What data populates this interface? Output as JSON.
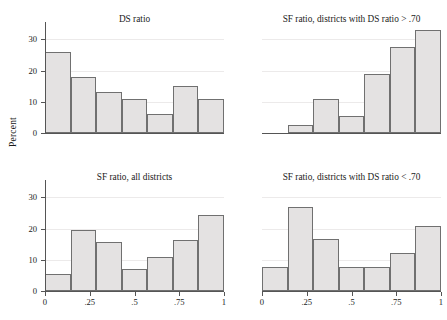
{
  "figure": {
    "ylabel": "Percent",
    "width": 439,
    "height": 320,
    "bar_fill": "#e4e2e2",
    "bar_stroke": "#707070",
    "grid_color": "#eceaea",
    "axis_color": "#555555"
  },
  "axes": {
    "y_ticks": [
      "0",
      "10",
      "20",
      "30"
    ],
    "y_values": [
      0,
      10,
      20,
      30
    ],
    "ylim": [
      0,
      34
    ],
    "x_ticks": [
      "0",
      ".25",
      ".5",
      ".75",
      "1"
    ],
    "x_values": [
      0,
      0.25,
      0.5,
      0.75,
      1
    ],
    "xlim": [
      0,
      1
    ]
  },
  "chart_data": [
    {
      "type": "bar",
      "panel": "top-left",
      "title": "DS ratio",
      "xlabel": "",
      "ylabel": "Percent",
      "ylim": [
        0,
        34
      ],
      "xlim": [
        0,
        1
      ],
      "grid": true,
      "bin_edges": [
        0,
        0.1429,
        0.2857,
        0.4286,
        0.5714,
        0.7143,
        0.8571,
        1.0
      ],
      "categories": [
        "0-.14",
        ".14-.29",
        ".29-.43",
        ".43-.57",
        ".57-.71",
        ".71-.86",
        ".86-1"
      ],
      "values": [
        26.0,
        18.0,
        13.2,
        11.0,
        6.2,
        15.0,
        11.0
      ]
    },
    {
      "type": "bar",
      "panel": "top-right",
      "title": "SF ratio, districts with DS ratio > .70",
      "xlabel": "",
      "ylabel": "Percent",
      "ylim": [
        0,
        34
      ],
      "xlim": [
        0,
        1
      ],
      "grid": true,
      "bin_edges": [
        0,
        0.1429,
        0.2857,
        0.4286,
        0.5714,
        0.7143,
        0.8571,
        1.0
      ],
      "categories": [
        "0-.14",
        ".14-.29",
        ".29-.43",
        ".43-.57",
        ".57-.71",
        ".71-.86",
        ".86-1"
      ],
      "values": [
        0,
        2.5,
        11.0,
        5.5,
        19.0,
        27.5,
        33.0
      ]
    },
    {
      "type": "bar",
      "panel": "bottom-left",
      "title": "SF ratio, all districts",
      "xlabel": "",
      "ylabel": "Percent",
      "ylim": [
        0,
        34
      ],
      "xlim": [
        0,
        1
      ],
      "grid": true,
      "bin_edges": [
        0,
        0.1429,
        0.2857,
        0.4286,
        0.5714,
        0.7143,
        0.8571,
        1.0
      ],
      "categories": [
        "0-.14",
        ".14-.29",
        ".29-.43",
        ".43-.57",
        ".57-.71",
        ".71-.86",
        ".86-1"
      ],
      "values": [
        5.5,
        19.7,
        15.7,
        7.0,
        11.0,
        16.5,
        24.3
      ]
    },
    {
      "type": "bar",
      "panel": "bottom-right",
      "title": "SF ratio, districts with DS ratio < .70",
      "xlabel": "",
      "ylabel": "Percent",
      "ylim": [
        0,
        34
      ],
      "xlim": [
        0,
        1
      ],
      "grid": true,
      "bin_edges": [
        0,
        0.1429,
        0.2857,
        0.4286,
        0.5714,
        0.7143,
        0.8571,
        1.0
      ],
      "categories": [
        "0-.14",
        ".14-.29",
        ".29-.43",
        ".43-.57",
        ".57-.71",
        ".71-.86",
        ".86-1"
      ],
      "values": [
        7.7,
        27.0,
        16.7,
        7.7,
        7.7,
        12.3,
        21.0
      ]
    }
  ]
}
